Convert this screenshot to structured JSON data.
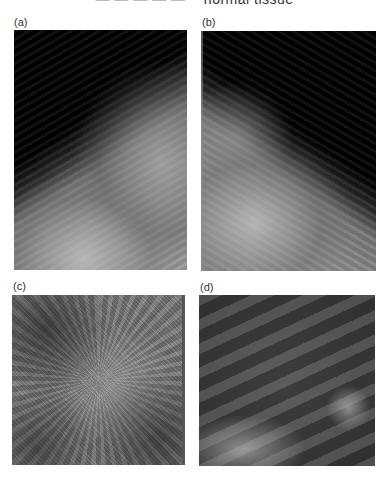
{
  "header": {
    "left_fragment": "— — — — —",
    "title_fragment": "normal tissue"
  },
  "figure": {
    "panels": [
      {
        "id": "a",
        "label": "(a)",
        "description": "Mammogram view, breast tissue extending from lower-left to upper-right on dark background"
      },
      {
        "id": "b",
        "label": "(b)",
        "description": "Mammogram view, mirrored orientation with tissue at left"
      },
      {
        "id": "c",
        "label": "(c)",
        "description": "Close-up tissue region with fine grainy texture"
      },
      {
        "id": "d",
        "label": "(d)",
        "description": "Close-up tissue region with smooth diagonal structures"
      }
    ]
  }
}
